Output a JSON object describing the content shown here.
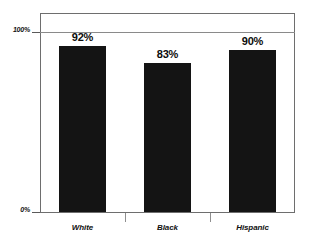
{
  "chart_data": {
    "type": "bar",
    "title": "",
    "subtitle": "",
    "xlabel": "",
    "ylabel": "",
    "categories": [
      "White",
      "Black",
      "Hispanic"
    ],
    "values": [
      92,
      83,
      90
    ],
    "value_labels": [
      "92%",
      "83%",
      "90%"
    ],
    "ylim": [
      0,
      100
    ],
    "ytick_labels": [
      "100%",
      "0%"
    ],
    "ytick_values": [
      100,
      0
    ],
    "grid": "horizontal-at-100",
    "legend": "none",
    "bar_color": "#141414",
    "frame_color": "#6e6e6e",
    "gridline_color": "#8a8a8a",
    "text_color": "#101010",
    "background_color": "#ffffff"
  },
  "axis": {
    "y_top_label": "100%",
    "y_bottom_label": "0%"
  },
  "bars": [
    {
      "category": "White",
      "value": 92,
      "label": "92%"
    },
    {
      "category": "Black",
      "value": 83,
      "label": "83%"
    },
    {
      "category": "Hispanic",
      "value": 90,
      "label": "90%"
    }
  ]
}
